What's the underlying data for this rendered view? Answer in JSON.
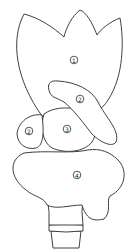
{
  "diagram": {
    "type": "color-by-number line art",
    "regions": [
      {
        "id": "petal",
        "label": "1",
        "x": 74,
        "y": 60
      },
      {
        "id": "leaf",
        "label": "2",
        "x": 80,
        "y": 99
      },
      {
        "id": "left-bud",
        "label": "2",
        "x": 29,
        "y": 130
      },
      {
        "id": "center-bud",
        "label": "3",
        "x": 67,
        "y": 129
      },
      {
        "id": "base-foliage",
        "label": "4",
        "x": 77,
        "y": 175
      }
    ],
    "colors": {
      "stroke": "#2a2a2a",
      "fill": "#ffffff"
    }
  }
}
